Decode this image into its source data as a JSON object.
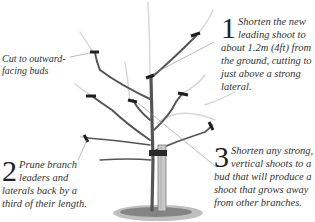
{
  "annotations": {
    "cut_note": {
      "line1": "Cut to outward-",
      "line2": "facing buds"
    },
    "step1": {
      "number": "1",
      "text": "Shorten the new leading shoot to about 1.2m (4ft) from the ground, cutting to just above a strong lateral."
    },
    "step2": {
      "number": "2",
      "text": "Prune branch leaders and laterals back by a third of their length."
    },
    "step3": {
      "number": "3",
      "text": "Shorten any strong, vertical shoots to a bud that will produce a shoot that grows away from other branches."
    }
  },
  "illustration": {
    "subject": "young-fruit-tree-with-stake",
    "colors": {
      "branch": "#5a5a5a",
      "cut_mark": "#1e1e1e",
      "pruned_growth": "#d8d8d8",
      "leader_line": "#9a9a9a",
      "stake": "#bdbdbd",
      "ground": "#6b6b6b"
    }
  }
}
